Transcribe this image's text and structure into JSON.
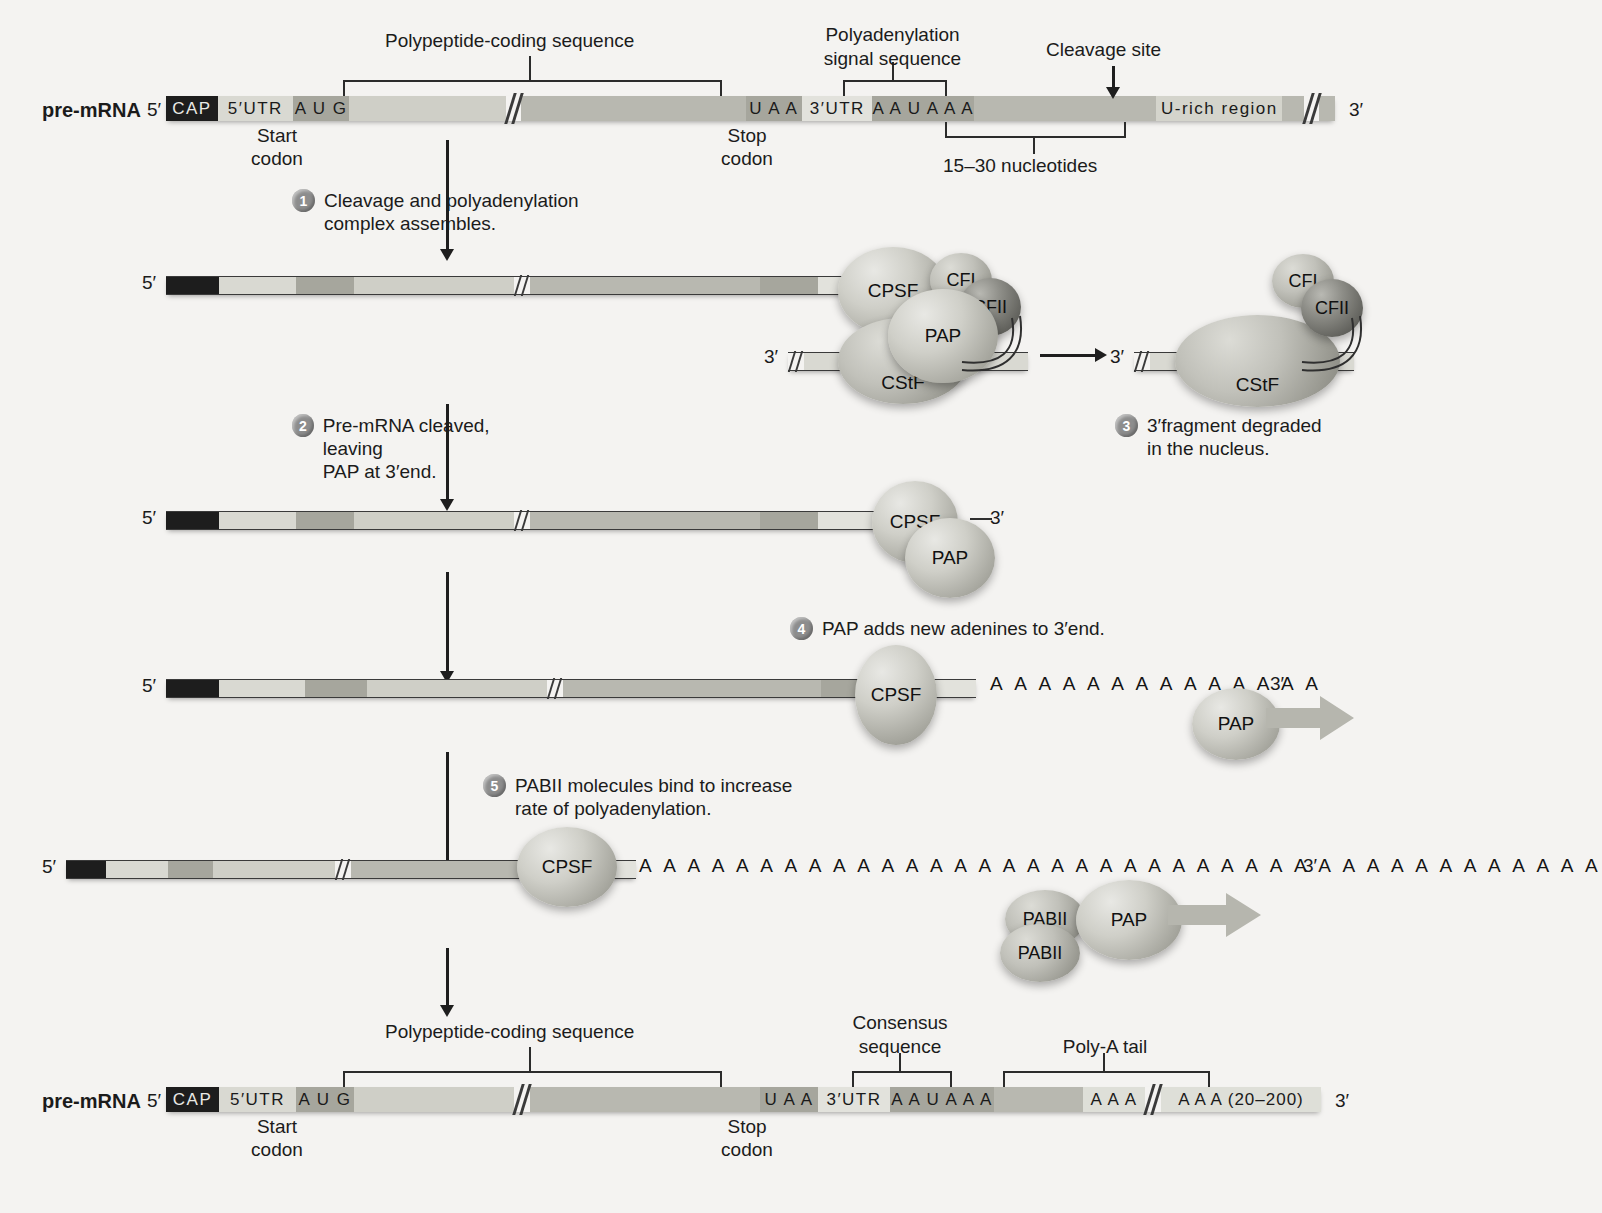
{
  "figure": {
    "background": "#f4f3f1",
    "mrna_label": "pre-mRNA",
    "five_prime": "5′",
    "three_prime": "3′"
  },
  "top_diagram": {
    "row_label": "pre-mRNA",
    "five_prime": "5′",
    "three_prime": "3′",
    "segments": [
      {
        "name": "cap",
        "text": "CAP",
        "color": "#1d1d1d",
        "text_color": "#e9e9e5"
      },
      {
        "name": "five-utr",
        "text": "5′UTR",
        "color": "#d9d9d2",
        "text_color": "#1a1a1a"
      },
      {
        "name": "start-codon",
        "text": "A U G",
        "color": "#a6a69d",
        "text_color": "#1a1a1a"
      },
      {
        "name": "coding-1",
        "text": "",
        "color": "#cfcfc7",
        "text_color": "#1a1a1a"
      },
      {
        "name": "coding-2",
        "text": "",
        "color": "#b8b8b0",
        "text_color": "#1a1a1a"
      },
      {
        "name": "stop-codon",
        "text": "U A A",
        "color": "#a6a69d",
        "text_color": "#1a1a1a"
      },
      {
        "name": "three-utr",
        "text": "3′UTR",
        "color": "#e2e2dc",
        "text_color": "#1a1a1a"
      },
      {
        "name": "poly-a-signal",
        "text": "A A U A A A",
        "color": "#a6a69d",
        "text_color": "#1a1a1a"
      },
      {
        "name": "downstream",
        "text": "",
        "color": "#b8b8b0",
        "text_color": "#1a1a1a"
      },
      {
        "name": "u-rich-region",
        "text": "U-rich region",
        "color": "#d4d4cc",
        "text_color": "#1a1a1a"
      },
      {
        "name": "tail-end",
        "text": "",
        "color": "#b8b8b0",
        "text_color": "#1a1a1a"
      }
    ],
    "brackets": {
      "polypeptide_coding": "Polypeptide-coding sequence",
      "polyadenylation_signal_line1": "Polyadenylation",
      "polyadenylation_signal_line2": "signal sequence",
      "cleavage_site": "Cleavage site",
      "nucleotide_span": "15–30 nucleotides"
    },
    "callouts": {
      "start_line1": "Start",
      "start_line2": "codon",
      "stop_line1": "Stop",
      "stop_line2": "codon"
    }
  },
  "steps": [
    {
      "num": "1",
      "line1": "Cleavage and polyadenylation",
      "line2": "complex assembles."
    },
    {
      "num": "2",
      "line1": "Pre-mRNA cleaved, leaving",
      "line2": "PAP at 3′end."
    },
    {
      "num": "3",
      "line1": "3′fragment degraded",
      "line2": "in the nucleus."
    },
    {
      "num": "4",
      "line1": "PAP adds new adenines to 3′end.",
      "line2": ""
    },
    {
      "num": "5",
      "line1": "PABII molecules bind to increase",
      "line2": "rate of polyadenylation."
    }
  ],
  "proteins": {
    "cpsf": "CPSF",
    "cstf": "CStF",
    "cfi": "CFI",
    "cfii": "CFII",
    "pap": "PAP",
    "pabii": "PABII"
  },
  "stage1": {
    "five_prime": "5′",
    "three_prime_fragment": "3′",
    "blobs": [
      "CPSF",
      "CFI",
      "CFII",
      "PAP",
      "CStF"
    ]
  },
  "stage3": {
    "three_prime": "3′",
    "blobs": [
      "CFI",
      "CFII",
      "CStF"
    ]
  },
  "stage2": {
    "five_prime": "5′",
    "three_prime": "3′",
    "blobs": [
      "CPSF",
      "PAP"
    ]
  },
  "stage4": {
    "five_prime": "5′",
    "three_prime": "3′",
    "adenines": "A A A A A A A A A A A A A A",
    "blobs": [
      "CPSF",
      "PAP"
    ]
  },
  "stage5": {
    "five_prime": "5′",
    "three_prime": "3′",
    "adenines": "A A A A A A A A A A A A A A A A A A A A A A A A A A A A A A A A A A A A A A A A",
    "blobs": [
      "CPSF",
      "PABII",
      "PABII",
      "PAP"
    ]
  },
  "bottom_diagram": {
    "row_label": "pre-mRNA",
    "five_prime": "5′",
    "three_prime": "3′",
    "segments": [
      {
        "name": "cap",
        "text": "CAP",
        "color": "#1d1d1d",
        "text_color": "#e9e9e5"
      },
      {
        "name": "five-utr",
        "text": "5′UTR",
        "color": "#d9d9d2",
        "text_color": "#1a1a1a"
      },
      {
        "name": "start-codon",
        "text": "A U G",
        "color": "#a6a69d",
        "text_color": "#1a1a1a"
      },
      {
        "name": "coding-1",
        "text": "",
        "color": "#cfcfc7",
        "text_color": "#1a1a1a"
      },
      {
        "name": "coding-2",
        "text": "",
        "color": "#b8b8b0",
        "text_color": "#1a1a1a"
      },
      {
        "name": "stop-codon",
        "text": "U A A",
        "color": "#a6a69d",
        "text_color": "#1a1a1a"
      },
      {
        "name": "three-utr",
        "text": "3′UTR",
        "color": "#e2e2dc",
        "text_color": "#1a1a1a"
      },
      {
        "name": "consensus",
        "text": "A A U A A A",
        "color": "#a6a69d",
        "text_color": "#1a1a1a"
      },
      {
        "name": "spacer",
        "text": "",
        "color": "#b8b8b0",
        "text_color": "#1a1a1a"
      },
      {
        "name": "polya-start",
        "text": "A A A",
        "color": "#dedfd8",
        "text_color": "#1a1a1a"
      },
      {
        "name": "polya-end",
        "text": "A A A (20–200)",
        "color": "#dedfd8",
        "text_color": "#1a1a1a"
      }
    ],
    "brackets": {
      "polypeptide_coding": "Polypeptide-coding sequence",
      "consensus_line1": "Consensus",
      "consensus_line2": "sequence",
      "poly_a_tail": "Poly-A tail"
    },
    "callouts": {
      "start_line1": "Start",
      "start_line2": "codon",
      "stop_line1": "Stop",
      "stop_line2": "codon"
    }
  }
}
